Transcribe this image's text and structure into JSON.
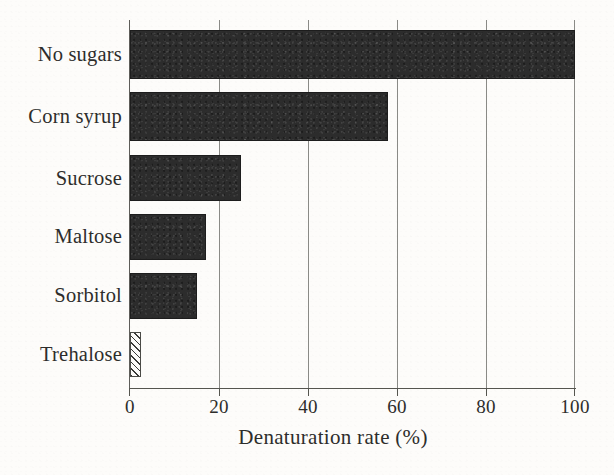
{
  "chart_data": {
    "type": "bar",
    "orientation": "horizontal",
    "title": "",
    "xlabel": "Denaturation rate (%)",
    "ylabel": "",
    "categories": [
      "No sugars",
      "Corn syrup",
      "Sucrose",
      "Maltose",
      "Sorbitol",
      "Trehalose"
    ],
    "values": [
      100,
      58,
      25,
      17,
      15,
      2.5
    ],
    "xlim": [
      0,
      100
    ],
    "xticks": [
      0,
      20,
      40,
      60,
      80,
      100
    ],
    "xtick_labels": [
      "0",
      "20",
      "40",
      "60",
      "80",
      "100"
    ],
    "grid": "vertical gridlines at each x tick",
    "legend": "none",
    "bar_styles": [
      "solid-black",
      "solid-black",
      "solid-black",
      "solid-black",
      "solid-black",
      "diagonal-hatch"
    ],
    "series": [
      {
        "name": "Denaturation rate",
        "values": [
          100,
          58,
          25,
          17,
          15,
          2.5
        ]
      }
    ],
    "annotations": []
  },
  "axis": {
    "x_title": "Denaturation rate (%)",
    "tick_labels": [
      "0",
      "20",
      "40",
      "60",
      "80",
      "100"
    ]
  },
  "categories": [
    {
      "label": "No sugars",
      "value": 100,
      "style": "solid"
    },
    {
      "label": "Corn syrup",
      "value": 58,
      "style": "solid"
    },
    {
      "label": "Sucrose",
      "value": 25,
      "style": "solid"
    },
    {
      "label": "Maltose",
      "value": 17,
      "style": "solid"
    },
    {
      "label": "Sorbitol",
      "value": 15,
      "style": "solid"
    },
    {
      "label": "Trehalose",
      "value": 2.5,
      "style": "hatched"
    }
  ],
  "colors": {
    "bar_fill": "#2c2c2c",
    "bar_border": "#1d1d1d",
    "hatch_line": "#3a3a38",
    "axis": "#55554f",
    "gridline": "#8a8a86",
    "text": "#2d2d2b",
    "background": "#fdfcfa"
  }
}
